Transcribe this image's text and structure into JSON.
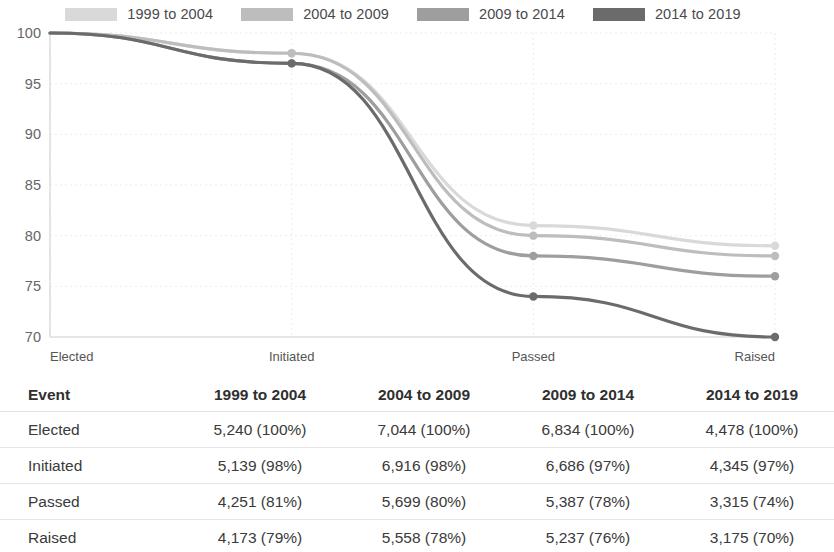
{
  "legend": {
    "items": [
      {
        "label": "1999 to 2004",
        "color": "#d9d9d9",
        "swatch_name": "legend-swatch-1999-2004"
      },
      {
        "label": "2004 to 2009",
        "color": "#bdbdbd",
        "swatch_name": "legend-swatch-2004-2009"
      },
      {
        "label": "2009 to 2014",
        "color": "#9e9e9e",
        "swatch_name": "legend-swatch-2009-2014"
      },
      {
        "label": "2014 to 2019",
        "color": "#6b6b6b",
        "swatch_name": "legend-swatch-2014-2019"
      }
    ]
  },
  "chart_data": {
    "type": "line",
    "title": "",
    "subtitle": "",
    "xlabel": "",
    "ylabel": "",
    "categories": [
      "Elected",
      "Initiated",
      "Passed",
      "Raised"
    ],
    "x_tick_labels": [
      "Elected",
      "Initiated",
      "Passed",
      "Raised"
    ],
    "y_tick_labels": [
      "100",
      "95",
      "90",
      "85",
      "80",
      "75",
      "70"
    ],
    "y_ticks": [
      100,
      95,
      90,
      85,
      80,
      75,
      70
    ],
    "ylim": [
      70,
      100
    ],
    "xlim": [
      0,
      3
    ],
    "grid": true,
    "legend_position": "top",
    "markers": true,
    "interpolation": "smooth",
    "series": [
      {
        "name": "1999 to 2004",
        "color": "#d9d9d9",
        "values": [
          100,
          98,
          81,
          79
        ]
      },
      {
        "name": "2004 to 2009",
        "color": "#bdbdbd",
        "values": [
          100,
          98,
          80,
          78
        ]
      },
      {
        "name": "2009 to 2014",
        "color": "#9e9e9e",
        "values": [
          100,
          97,
          78,
          76
        ]
      },
      {
        "name": "2014 to 2019",
        "color": "#6b6b6b",
        "values": [
          100,
          97,
          74,
          70
        ]
      }
    ]
  },
  "table": {
    "headers": [
      "Event",
      "1999 to 2004",
      "2004 to 2009",
      "2009 to 2014",
      "2014 to 2019"
    ],
    "rows": [
      {
        "event": "Elected",
        "c1": "5,240 (100%)",
        "c2": "7,044 (100%)",
        "c3": "6,834 (100%)",
        "c4": "4,478 (100%)"
      },
      {
        "event": "Initiated",
        "c1": "5,139 (98%)",
        "c2": "6,916 (98%)",
        "c3": "6,686 (97%)",
        "c4": "4,345 (97%)"
      },
      {
        "event": "Passed",
        "c1": "4,251 (81%)",
        "c2": "5,699 (80%)",
        "c3": "5,387 (78%)",
        "c4": "3,315 (74%)"
      },
      {
        "event": "Raised",
        "c1": "4,173 (79%)",
        "c2": "5,558 (78%)",
        "c3": "5,237 (76%)",
        "c4": "3,175 (70%)"
      }
    ]
  },
  "colors": {
    "background": "#ffffff",
    "grid": "#ececec",
    "axis": "#d5d5d5",
    "text": "#3c3c3c"
  }
}
